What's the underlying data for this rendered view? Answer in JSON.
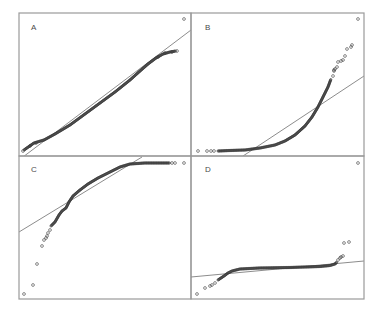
{
  "figure": {
    "border_color": "#9a9a9a",
    "line_color": "#6e6e6e",
    "point_color": "#3a3a3a"
  },
  "chart_data": [
    {
      "type": "scatter",
      "title": "A",
      "label": "A",
      "kind": "qq-plot",
      "shape": "approximately normal (points follow reference line)",
      "xlabel": "",
      "ylabel": "",
      "grid": false,
      "box": {
        "x0": 19,
        "y0": 13,
        "x1": 191,
        "y1": 156
      },
      "ref_line": [
        [
          19,
          160
        ],
        [
          191,
          30
        ]
      ],
      "curve": [
        [
          24,
          150
        ],
        [
          34,
          143
        ],
        [
          44,
          140
        ],
        [
          55,
          134
        ],
        [
          70,
          125
        ],
        [
          85,
          114
        ],
        [
          100,
          103
        ],
        [
          115,
          92
        ],
        [
          130,
          80
        ],
        [
          140,
          71
        ],
        [
          148,
          64
        ],
        [
          156,
          58
        ],
        [
          163,
          54
        ],
        [
          170,
          52
        ],
        [
          176,
          51
        ]
      ],
      "outliers": [
        [
          23,
          151
        ],
        [
          30,
          146
        ],
        [
          36,
          143
        ],
        [
          158,
          57
        ],
        [
          165,
          53
        ],
        [
          172,
          52
        ],
        [
          177,
          51
        ],
        [
          184,
          19
        ]
      ]
    },
    {
      "type": "scatter",
      "title": "B",
      "label": "B",
      "kind": "qq-plot",
      "shape": "right-skewed (convex curve above line at upper tail)",
      "xlabel": "",
      "ylabel": "",
      "grid": false,
      "box": {
        "x0": 191,
        "y0": 13,
        "x1": 364,
        "y1": 156
      },
      "ref_line": [
        [
          243,
          156
        ],
        [
          364,
          76
        ]
      ],
      "curve": [
        [
          218,
          151
        ],
        [
          230,
          150.5
        ],
        [
          245,
          150
        ],
        [
          260,
          148
        ],
        [
          275,
          145
        ],
        [
          285,
          141
        ],
        [
          295,
          135
        ],
        [
          305,
          126
        ],
        [
          312,
          117
        ],
        [
          318,
          107
        ],
        [
          323,
          97
        ],
        [
          328,
          87
        ],
        [
          331,
          79
        ]
      ],
      "outliers": [
        [
          198,
          151
        ],
        [
          207,
          151
        ],
        [
          211,
          151
        ],
        [
          214,
          151
        ],
        [
          333,
          76
        ],
        [
          334,
          71
        ],
        [
          334,
          70
        ],
        [
          335,
          69
        ],
        [
          337,
          67
        ],
        [
          338,
          62
        ],
        [
          341,
          61
        ],
        [
          343,
          60
        ],
        [
          345,
          56
        ],
        [
          347,
          49
        ],
        [
          351,
          47
        ],
        [
          352,
          45
        ],
        [
          358,
          19
        ]
      ]
    },
    {
      "type": "scatter",
      "title": "C",
      "label": "C",
      "kind": "qq-plot",
      "shape": "left-skewed (concave curve, long lower tail)",
      "xlabel": "",
      "ylabel": "",
      "grid": false,
      "box": {
        "x0": 19,
        "y0": 156,
        "x1": 191,
        "y1": 299
      },
      "ref_line": [
        [
          19,
          232
        ],
        [
          142,
          157
        ]
      ],
      "curve": [
        [
          51,
          226
        ],
        [
          55,
          222
        ],
        [
          59,
          215
        ],
        [
          62,
          211
        ],
        [
          66,
          208
        ],
        [
          69,
          202
        ],
        [
          73,
          196
        ],
        [
          80,
          190
        ],
        [
          88,
          184
        ],
        [
          98,
          178
        ],
        [
          110,
          172
        ],
        [
          120,
          167
        ],
        [
          130,
          164
        ],
        [
          145,
          163
        ],
        [
          160,
          163
        ],
        [
          170,
          163
        ]
      ],
      "outliers": [
        [
          42,
          246
        ],
        [
          44,
          240
        ],
        [
          46,
          238
        ],
        [
          47,
          236
        ],
        [
          48,
          233
        ],
        [
          50,
          230
        ],
        [
          37,
          264
        ],
        [
          33,
          285
        ],
        [
          24,
          294
        ],
        [
          172,
          163
        ],
        [
          175,
          163
        ],
        [
          184,
          163
        ]
      ]
    },
    {
      "type": "scatter",
      "title": "D",
      "label": "D",
      "kind": "qq-plot",
      "shape": "heavy-tailed (S-shape, flat center with both tails deviating)",
      "xlabel": "",
      "ylabel": "",
      "grid": false,
      "box": {
        "x0": 191,
        "y0": 156,
        "x1": 364,
        "y1": 299
      },
      "ref_line": [
        [
          191,
          277
        ],
        [
          364,
          261
        ]
      ],
      "curve": [
        [
          218,
          280
        ],
        [
          224,
          276
        ],
        [
          228,
          273
        ],
        [
          232,
          271
        ],
        [
          240,
          269
        ],
        [
          260,
          268
        ],
        [
          290,
          267.5
        ],
        [
          320,
          266.5
        ],
        [
          330,
          265.5
        ],
        [
          335,
          264
        ],
        [
          337,
          262
        ]
      ],
      "outliers": [
        [
          197,
          294
        ],
        [
          205,
          288
        ],
        [
          210,
          286
        ],
        [
          212,
          285
        ],
        [
          215,
          283
        ],
        [
          338,
          260
        ],
        [
          340,
          258
        ],
        [
          341,
          257
        ],
        [
          343,
          256
        ],
        [
          344,
          243
        ],
        [
          349,
          242
        ],
        [
          358,
          163
        ]
      ]
    }
  ]
}
